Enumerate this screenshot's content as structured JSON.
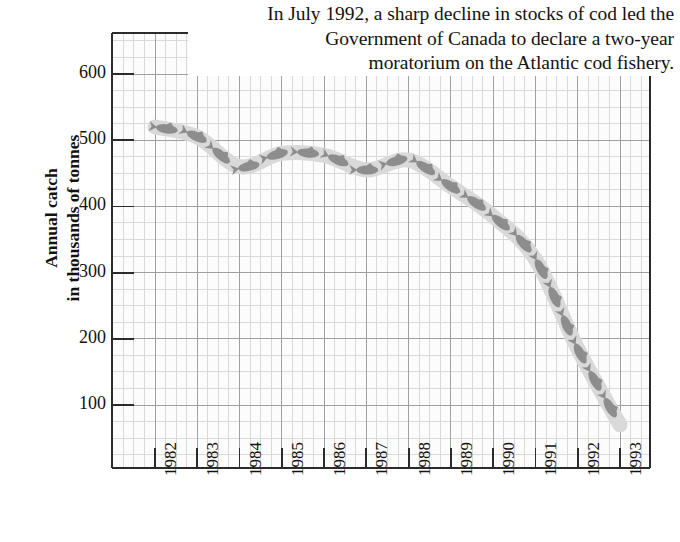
{
  "annotation": {
    "line1": "In July 1992, a sharp decline in stocks of cod led the",
    "line2": "Government of Canada to declare a two-year",
    "line3": "moratorium on the Atlantic cod fishery."
  },
  "axis_title": {
    "line1": "Annual catch",
    "line2": "in thousands of tonnes"
  },
  "colors": {
    "band": "#d9d9d9",
    "fish": "#8d8d8d",
    "grid_major": "#9a9a9a",
    "grid_minor": "#d5d5d5",
    "axis": "#2b2b2b",
    "text": "#14110f",
    "background": "#ffffff"
  },
  "chart_data": {
    "type": "line",
    "title": "",
    "subtitle": "",
    "xlabel": "",
    "ylabel": "Annual catch in thousands of tonnes",
    "x": [
      1982,
      1983,
      1984,
      1985,
      1986,
      1987,
      1988,
      1989,
      1990,
      1991,
      1992,
      1993
    ],
    "categories": [
      "1982",
      "1983",
      "1984",
      "1985",
      "1986",
      "1987",
      "1988",
      "1989",
      "1990",
      "1991",
      "1992",
      "1993"
    ],
    "values": [
      520,
      505,
      460,
      480,
      477,
      455,
      470,
      430,
      385,
      320,
      185,
      70
    ],
    "series": [
      {
        "name": "Annual catch",
        "values": [
          520,
          505,
          460,
          480,
          477,
          455,
          470,
          430,
          385,
          320,
          185,
          70
        ]
      }
    ],
    "ylim": [
      0,
      650
    ],
    "xlim": [
      1981.5,
      1993.5
    ],
    "yticks": [
      100,
      200,
      300,
      400,
      500,
      600
    ],
    "ytick_labels": [
      "100",
      "200",
      "300",
      "400",
      "500",
      "600"
    ],
    "xticks": [
      1982,
      1983,
      1984,
      1985,
      1986,
      1987,
      1988,
      1989,
      1990,
      1991,
      1992,
      1993
    ],
    "xtick_labels": [
      "1982",
      "1983",
      "1984",
      "1985",
      "1986",
      "1987",
      "1988",
      "1989",
      "1990",
      "1991",
      "1992",
      "1993"
    ],
    "grid": true,
    "grid_minor": true,
    "legend": false,
    "legend_position": "none",
    "annotations": [
      "In July 1992, a sharp decline in stocks of cod led the Government of Canada to declare a two-year moratorium on the Atlantic cod fishery."
    ],
    "style_note": "Line rendered as a thick light-grey band containing dark grey fish silhouettes"
  }
}
